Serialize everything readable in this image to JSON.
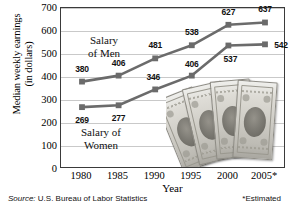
{
  "chart_data": {
    "type": "line",
    "title": "",
    "xlabel": "Year",
    "ylabel": "Median weekly earnings (in dollars)",
    "ylabel_line1": "Median weekly earnings",
    "ylabel_line2": "(in dollars)",
    "categories": [
      "1980",
      "1985",
      "1990",
      "1995",
      "2000",
      "2005*"
    ],
    "series": [
      {
        "name": "Salary of Men",
        "values": [
          380,
          406,
          481,
          538,
          627,
          637
        ]
      },
      {
        "name": "Salary of Women",
        "values": [
          269,
          277,
          346,
          406,
          537,
          542
        ]
      }
    ],
    "ylim": [
      0,
      700
    ],
    "yticks": [
      "700",
      "600",
      "500",
      "400",
      "300",
      "200",
      "100",
      "0"
    ],
    "grid": true,
    "legend_position": "inline-annotations",
    "annotations": [
      {
        "name": "salary-of-men",
        "line1": "Salary",
        "line2": "of Men"
      },
      {
        "name": "salary-of-women",
        "line1": "Salary of",
        "line2": "Women"
      }
    ],
    "series_color": "#6b6b6b",
    "grid_color": "#c9c9c9",
    "frame_color": "#3a3a3a"
  },
  "footer": {
    "source_prefix": "Source:",
    "source_text": "U.S. Bureau of Labor Statistics",
    "estimated_note": "*Estimated"
  },
  "decoration": {
    "money_image_name": "fanned-dollar-bills-photo"
  }
}
